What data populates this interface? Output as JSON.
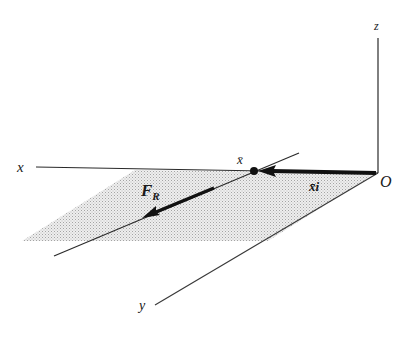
{
  "figure": {
    "type": "3D coordinate diagram",
    "colors": {
      "ink": "#1a1a1a",
      "shade": "#d4d4d4",
      "background": "#ffffff"
    },
    "axes": {
      "x": {
        "label": "x"
      },
      "y": {
        "label": "y"
      },
      "z": {
        "label": "z"
      },
      "origin": {
        "label": "O"
      }
    },
    "point": {
      "label": "x̄"
    },
    "vectors": [
      {
        "name": "position-vector",
        "label": "x̄i"
      },
      {
        "name": "resultant-force",
        "label_main": "F",
        "label_sub": "R"
      }
    ]
  }
}
